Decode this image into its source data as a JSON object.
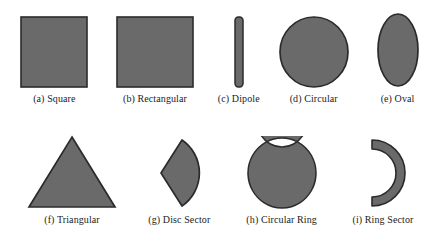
{
  "figure": {
    "background_color": "#ffffff",
    "shape_fill_color": "#6a6a6a",
    "shape_stroke_color": "#2b2b2b",
    "caption_color": "#1b1b1b"
  },
  "shapes": [
    {
      "id": "square",
      "icon": "filled-square-shape",
      "caption": "(a) Square",
      "row": "top"
    },
    {
      "id": "rectangular",
      "icon": "filled-rectangle-shape",
      "caption": "(b) Rectangular",
      "row": "top"
    },
    {
      "id": "dipole",
      "icon": "filled-thin-vertical-bar-shape",
      "caption": "(c) Dipole",
      "row": "top"
    },
    {
      "id": "circular",
      "icon": "filled-circle-shape",
      "caption": "(d) Circular",
      "row": "top"
    },
    {
      "id": "oval",
      "icon": "filled-ellipse-shape",
      "caption": "(e) Oval",
      "row": "top"
    },
    {
      "id": "triangular",
      "icon": "filled-triangle-shape",
      "caption": "(f) Triangular",
      "row": "bottom"
    },
    {
      "id": "disc-sector",
      "icon": "filled-disc-sector-shape",
      "caption": "(g) Disc Sector",
      "row": "bottom"
    },
    {
      "id": "circular-ring",
      "icon": "annulus-ring-shape",
      "caption": "(h) Circular Ring",
      "row": "bottom"
    },
    {
      "id": "ring-sector",
      "icon": "annulus-sector-arc-shape",
      "caption": "(i) Ring Sector",
      "row": "bottom"
    }
  ]
}
